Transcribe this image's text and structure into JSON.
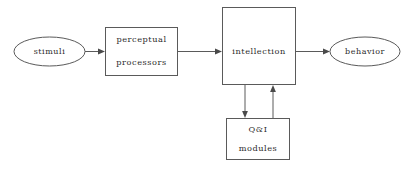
{
  "diagram": {
    "background_color": "#ffffff",
    "stroke_color": "#5a5a5a",
    "text_color": "#2b2b2b",
    "nodes": {
      "stimuli": {
        "label": "stimuli",
        "shape": "ellipse"
      },
      "perceptual_processors": {
        "label_line1": "perceptual",
        "label_line2": "processors",
        "shape": "rectangle"
      },
      "intellection": {
        "label": "intellection",
        "shape": "rectangle"
      },
      "behavior": {
        "label": "behavior",
        "shape": "ellipse"
      },
      "qi_modules": {
        "label_line1": "Q&I",
        "label_line2": "modules",
        "shape": "rectangle"
      }
    },
    "edges": [
      {
        "name": "stimuli-to-perceptual",
        "from": "stimuli",
        "to": "perceptual_processors",
        "direction": "right"
      },
      {
        "name": "perceptual-to-intellection",
        "from": "perceptual_processors",
        "to": "intellection",
        "direction": "right"
      },
      {
        "name": "intellection-to-behavior",
        "from": "intellection",
        "to": "behavior",
        "direction": "right"
      },
      {
        "name": "intellection-to-qi-modules",
        "from": "intellection",
        "to": "qi_modules",
        "direction": "down"
      },
      {
        "name": "qi-modules-to-intellection",
        "from": "qi_modules",
        "to": "intellection",
        "direction": "up"
      }
    ]
  }
}
